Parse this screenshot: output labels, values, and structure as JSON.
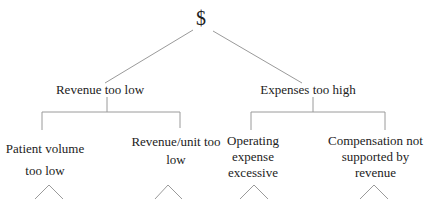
{
  "tree": {
    "root": {
      "label": "$"
    },
    "level1": [
      {
        "label": "Revenue too low"
      },
      {
        "label": "Expenses too high"
      }
    ],
    "level2": [
      {
        "label_line1": "Patient volume",
        "label_line2": "too low",
        "label_line3": ""
      },
      {
        "label_line1": "Revenue/unit too",
        "label_line2": "low",
        "label_line3": ""
      },
      {
        "label_line1": "Operating",
        "label_line2": "expense",
        "label_line3": "excessive"
      },
      {
        "label_line1": "Compensation not",
        "label_line2": "supported by",
        "label_line3": "revenue"
      }
    ]
  },
  "colors": {
    "line": "#9a9a9a",
    "text": "#222222",
    "background": "#ffffff"
  }
}
